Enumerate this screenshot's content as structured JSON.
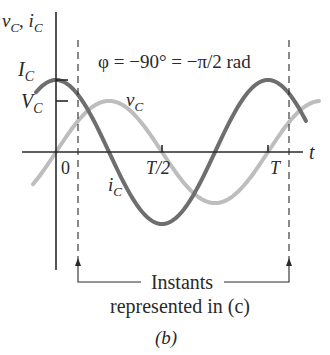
{
  "figure": {
    "axis_labels": {
      "y_main": "v",
      "y_sub1": "C",
      "y_sep": ", ",
      "y_main2": "i",
      "y_sub2": "C",
      "x": "t"
    },
    "amplitude_labels": {
      "current": "I",
      "current_sub": "C",
      "voltage": "V",
      "voltage_sub": "C"
    },
    "tick_labels": {
      "zero": "0",
      "half_period": "T/2",
      "period": "T"
    },
    "curve_labels": {
      "voltage": "v",
      "voltage_sub": "C",
      "current": "i",
      "current_sub": "C"
    },
    "phase_annotation": "φ = −90° = −π/2 rad",
    "instants_label_line1": "Instants",
    "instants_label_line2": "represented in (c)",
    "panel_label": "(b)",
    "colors": {
      "current_curve": "#6e6e6e",
      "voltage_curve": "#bdbdbd",
      "axes": "#2a2a2a",
      "text": "#2a2a2a"
    }
  },
  "chart_data": {
    "type": "line",
    "title": "φ = −90° = −π/2 rad",
    "xlabel": "t",
    "ylabel": "v_C, i_C",
    "x_ticks": [
      "0",
      "T/2",
      "T"
    ],
    "x_range_periods": [
      -0.16,
      1.17
    ],
    "series": [
      {
        "name": "i_C",
        "description": "current, I_C cos(ωt)",
        "amplitude_label": "I_C",
        "relative_amplitude": 1.0,
        "phase_offset_deg": 90,
        "color": "#6e6e6e"
      },
      {
        "name": "v_C",
        "description": "voltage, V_C sin(ωt)",
        "amplitude_label": "V_C",
        "relative_amplitude": 0.71,
        "phase_offset_deg": 0,
        "color": "#bdbdbd"
      }
    ],
    "annotations": [
      {
        "type": "dashed_vertical",
        "x_period": 0.1
      },
      {
        "type": "dashed_vertical",
        "x_period": 1.1
      },
      {
        "type": "bracket",
        "text": "Instants represented in (c)"
      }
    ],
    "grid": false,
    "legend": "inline labels"
  }
}
